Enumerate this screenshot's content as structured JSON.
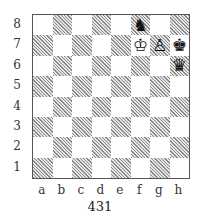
{
  "diagram": {
    "caption": "431",
    "ranks": [
      "8",
      "7",
      "6",
      "5",
      "4",
      "3",
      "2",
      "1"
    ],
    "files": [
      "a",
      "b",
      "c",
      "d",
      "e",
      "f",
      "g",
      "h"
    ],
    "pieces": [
      {
        "square": "f8",
        "color": "black",
        "type": "knight",
        "glyph": "♞"
      },
      {
        "square": "f7",
        "color": "white",
        "type": "king",
        "glyph": "♔"
      },
      {
        "square": "g7",
        "color": "white",
        "type": "pawn",
        "glyph": "♙"
      },
      {
        "square": "h7",
        "color": "black",
        "type": "king",
        "glyph": "♚"
      },
      {
        "square": "h6",
        "color": "black",
        "type": "queen",
        "glyph": "♛"
      }
    ],
    "colors": {
      "light_square": "#ffffff",
      "dark_square_hatch": "#8a8a8a",
      "border": "#555555"
    }
  }
}
